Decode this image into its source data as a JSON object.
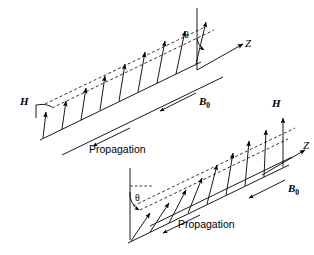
{
  "figure": {
    "background_color": "#ffffff",
    "line_color": "#000000",
    "width": 314,
    "height": 255
  },
  "diagrams": [
    {
      "id": "upper",
      "labels": {
        "h_field": "H",
        "b_field": "B",
        "b_field_sub": "0",
        "axis": "Z",
        "angle": "θ",
        "propagation": "Propagation"
      },
      "geometry": {
        "baseline_start": [
          40,
          140
        ],
        "baseline_end": [
          200,
          63
        ],
        "arrow_count": 9,
        "tilt_deg": 12,
        "envelope": "dashed"
      }
    },
    {
      "id": "lower",
      "labels": {
        "h_field": "H",
        "b_field": "B",
        "b_field_sub": "0",
        "axis": "Z",
        "angle": "θ",
        "propagation": "Propagation"
      },
      "geometry": {
        "baseline_start": [
          128,
          243
        ],
        "baseline_end": [
          288,
          166
        ],
        "arrow_count": 9,
        "tilt_deg": 28,
        "envelope": "dashed"
      }
    }
  ]
}
